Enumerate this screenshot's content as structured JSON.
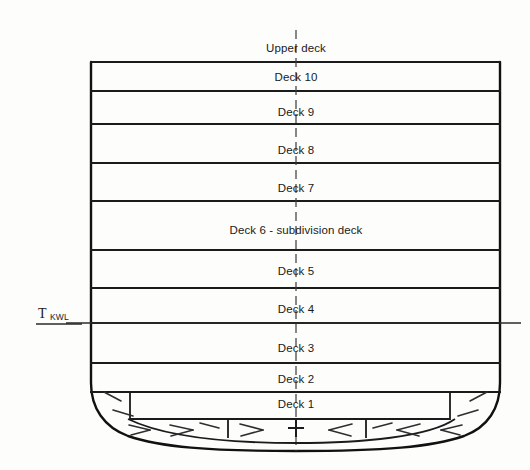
{
  "diagram": {
    "type": "naval-architecture-section",
    "colors": {
      "background": "#fdfdfc",
      "line": "#111111",
      "text": "#1a1a1a",
      "hatch": "#2e2e2e"
    }
  },
  "labels": {
    "upper_deck": "Upper deck",
    "deck_10": "Deck 10",
    "deck_9": "Deck 9",
    "deck_8": "Deck 8",
    "deck_7": "Deck 7",
    "deck_6": "Deck 6 - subdivision deck",
    "deck_5": "Deck 5",
    "deck_4": "Deck 4",
    "deck_3": "Deck 3",
    "deck_2": "Deck 2",
    "deck_1": "Deck 1"
  },
  "waterline": {
    "symbol": "T",
    "subscript": "KWL",
    "description": "Design waterline (Konstruktionswasserlinie)"
  },
  "decks": [
    {
      "name": "Upper deck",
      "label": "Upper deck",
      "index": 11,
      "above_hull": true
    },
    {
      "name": "Deck 10",
      "label": "Deck 10",
      "index": 10,
      "above_hull": false
    },
    {
      "name": "Deck 9",
      "label": "Deck 9",
      "index": 9,
      "above_hull": false
    },
    {
      "name": "Deck 8",
      "label": "Deck 8",
      "index": 8,
      "above_hull": false
    },
    {
      "name": "Deck 7",
      "label": "Deck 7",
      "index": 7,
      "above_hull": false
    },
    {
      "name": "Deck 6 - subdivision deck",
      "label": "Deck 6 - subdivision deck",
      "index": 6,
      "above_hull": false
    },
    {
      "name": "Deck 5",
      "label": "Deck 5",
      "index": 5,
      "above_hull": false
    },
    {
      "name": "Deck 4",
      "label": "Deck 4",
      "index": 4,
      "above_hull": false
    },
    {
      "name": "Deck 3",
      "label": "Deck 3",
      "index": 3,
      "above_hull": false
    },
    {
      "name": "Deck 2",
      "label": "Deck 2",
      "index": 2,
      "above_hull": false
    },
    {
      "name": "Deck 1",
      "label": "Deck 1",
      "index": 1,
      "above_hull": false
    }
  ],
  "icons": {
    "centerline": "centerline-dashed",
    "waterline": "waterline-marker",
    "cross": "centerline-cross-marker"
  }
}
